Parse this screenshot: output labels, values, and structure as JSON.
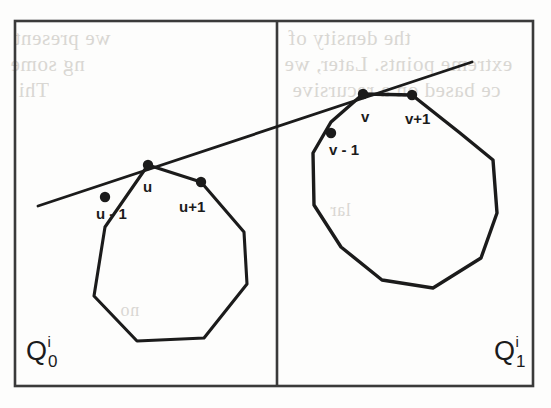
{
  "figure": {
    "panels": [
      {
        "id": "left-panel",
        "label_base": "Q",
        "label_sub": "0",
        "label_sup": "i",
        "label_x": 26,
        "label_y": 336,
        "polygon_name": "left-polygon",
        "vertices": [
          [
            148,
            165
          ],
          [
            201,
            182
          ],
          [
            244,
            232
          ],
          [
            247,
            284
          ],
          [
            204,
            338
          ],
          [
            137,
            341
          ],
          [
            94,
            296
          ],
          [
            105,
            227
          ]
        ],
        "marked_points": [
          {
            "name": "u",
            "x": 148,
            "y": 165,
            "label": "u",
            "label_x": 143,
            "label_y": 178
          },
          {
            "name": "u-1",
            "x": 105,
            "y": 197,
            "label": "u - 1",
            "label_x": 96,
            "label_y": 205
          },
          {
            "name": "u+1",
            "x": 201,
            "y": 182,
            "label": "u+1",
            "label_x": 179,
            "label_y": 198
          }
        ]
      },
      {
        "id": "right-panel",
        "label_base": "Q",
        "label_sub": "1",
        "label_sup": "i",
        "label_x": 494,
        "label_y": 336,
        "polygon_name": "right-polygon",
        "vertices": [
          [
            363,
            94
          ],
          [
            412,
            95
          ],
          [
            460,
            133
          ],
          [
            493,
            160
          ],
          [
            497,
            213
          ],
          [
            481,
            258
          ],
          [
            433,
            288
          ],
          [
            382,
            280
          ],
          [
            341,
            247
          ],
          [
            314,
            205
          ],
          [
            313,
            153
          ],
          [
            331,
            122
          ]
        ],
        "marked_points": [
          {
            "name": "v",
            "x": 363,
            "y": 94,
            "label": "v",
            "label_x": 361,
            "label_y": 108
          },
          {
            "name": "v+1",
            "x": 412,
            "y": 95,
            "label": "v+1",
            "label_x": 405,
            "label_y": 110
          },
          {
            "name": "v-1",
            "x": 331,
            "y": 133,
            "label": "v - 1",
            "label_x": 329,
            "label_y": 141
          }
        ]
      }
    ],
    "tangent_line": {
      "name": "common-tangent-line",
      "x1": 38,
      "y1": 206,
      "x2": 472,
      "y2": 62
    },
    "frame": {
      "x": 15,
      "y": 21,
      "width": 518,
      "height": 365,
      "divider_x": 277
    },
    "colors": {
      "ink": "#1b1b1b",
      "paper": "#fdfdfc",
      "bleed": "#d9d7d3"
    },
    "bleed_text": {
      "line1": "we present",
      "line2": "ng some",
      "line3": "Thi",
      "line4": "the density of",
      "line5": "extreme points. Later, we",
      "line6": "ce based on a recursive",
      "line7": "no",
      "line8": "lar"
    }
  }
}
